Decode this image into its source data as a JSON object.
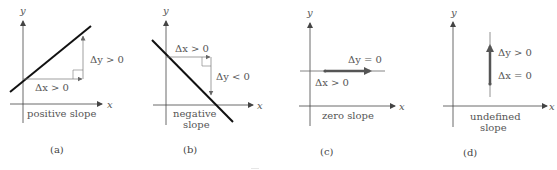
{
  "figure": {
    "panels": [
      {
        "id": "a",
        "caption": "(a)",
        "axis_x_label": "x",
        "axis_y_label": "y",
        "slope_label_lines": [
          "positive slope"
        ],
        "dx_label": "Δx > 0",
        "dy_label": "Δy > 0",
        "type": "positive"
      },
      {
        "id": "b",
        "caption": "(b)",
        "axis_x_label": "x",
        "axis_y_label": "y",
        "slope_label_lines": [
          "negative",
          "slope"
        ],
        "dx_label": "Δx > 0",
        "dy_label": "Δy < 0",
        "type": "negative"
      },
      {
        "id": "c",
        "caption": "(c)",
        "axis_x_label": "x",
        "axis_y_label": "y",
        "slope_label_lines": [
          "zero slope"
        ],
        "dx_label": "Δx > 0",
        "dy_label": "Δy = 0",
        "type": "zero"
      },
      {
        "id": "d",
        "caption": "(d)",
        "axis_x_label": "x",
        "axis_y_label": "y",
        "slope_label_lines": [
          "undefined",
          "slope"
        ],
        "dx_label": "Δx = 0",
        "dy_label": "Δy > 0",
        "type": "undefined"
      }
    ],
    "colors": {
      "line": "#111111",
      "axis": "#444444",
      "arrow": "#555555",
      "thick_arrow": "#555555"
    }
  }
}
